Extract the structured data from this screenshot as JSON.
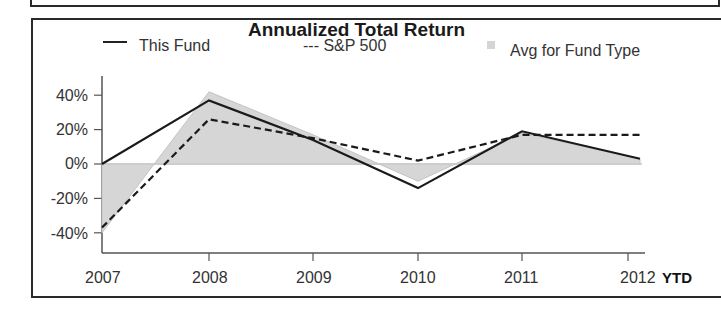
{
  "chart_data": {
    "type": "line",
    "title": "Annualized Total Return",
    "xlabel": "",
    "ylabel": "",
    "categories": [
      "2007",
      "2008",
      "2009",
      "2010",
      "2011",
      "2012 YTD"
    ],
    "x_tick_labels": [
      "2007",
      "2008",
      "2009",
      "2010",
      "2011",
      "2012"
    ],
    "x_suffix_label": "YTD",
    "y_tick_labels": [
      "40%",
      "20%",
      "0%",
      "-20%",
      "-40%"
    ],
    "ylim": [
      -50,
      50
    ],
    "grid": false,
    "legend_position": "top",
    "series": [
      {
        "name": "This Fund",
        "style": "solid",
        "values": [
          0,
          37,
          14,
          -14,
          19,
          3
        ]
      },
      {
        "name": "S&P 500",
        "style": "dashed",
        "values": [
          -37,
          26,
          15,
          2,
          17,
          17
        ]
      },
      {
        "name": "Avg for Fund Type",
        "style": "area",
        "color": "#d4d4d4",
        "values": [
          -40,
          42,
          17,
          -10,
          18,
          3
        ]
      }
    ]
  },
  "legend": {
    "this_fund": "This Fund",
    "sp500": "--- S&P 500",
    "avg": "Avg for Fund Type"
  }
}
